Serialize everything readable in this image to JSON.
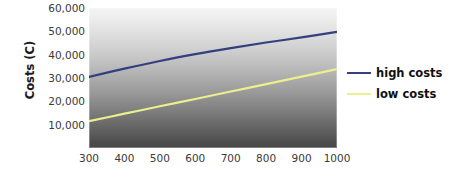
{
  "chart_data": {
    "type": "line",
    "title": "",
    "subtitle": "",
    "xlabel": "",
    "ylabel": "Costs (C)",
    "xlim": [
      300,
      1000
    ],
    "ylim": [
      0,
      60000
    ],
    "grid": false,
    "legend_position": "right",
    "background": "vertical gradient light-gray to dark-gray",
    "x": [
      300,
      400,
      500,
      600,
      700,
      800,
      900,
      1000
    ],
    "xticks": [
      "300",
      "400",
      "500",
      "600",
      "700",
      "800",
      "900",
      "1000"
    ],
    "yticks": [
      "10,000",
      "20,000",
      "30,000",
      "40,000",
      "50,000",
      "60,000"
    ],
    "ytick_values": [
      10000,
      20000,
      30000,
      40000,
      50000,
      60000
    ],
    "series": [
      {
        "name": "high costs",
        "color": "#333f7f",
        "values": [
          30500,
          34000,
          37300,
          40200,
          42800,
          45200,
          47400,
          49800
        ]
      },
      {
        "name": "low costs",
        "color": "#eaf08c",
        "values": [
          11500,
          14700,
          17900,
          21000,
          24200,
          27400,
          30600,
          33800
        ]
      }
    ]
  },
  "legend": {
    "entries": [
      {
        "label": "high costs",
        "color": "#333f7f"
      },
      {
        "label": "low costs",
        "color": "#eaf08c"
      }
    ]
  },
  "axes": {
    "y_title": "Costs (C)"
  }
}
